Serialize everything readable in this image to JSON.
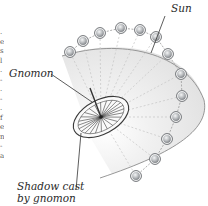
{
  "labels": {
    "sun": "Sun",
    "gnomon": "Gnomon",
    "shadow_line1": "Shadow cast",
    "shadow_line2": "by gnomon"
  },
  "edge_text_fragments": [
    ".",
    "e",
    "s",
    "l",
    ".",
    "-",
    ".",
    "-",
    ".",
    "f",
    "e",
    "n",
    "-",
    "a"
  ],
  "colors": {
    "background": "#ffffff",
    "dome_fill": "#e8e8e8",
    "dome_edge": "#8c8c8c",
    "sun_body": "#b9bcbf",
    "sun_ring": "#6e7175",
    "rays": "#c4c4c4",
    "dial_lines": "#3a3a3a",
    "text": "#2a2a2a"
  },
  "diagram": {
    "sun_count": 13,
    "dial_spokes": 24
  }
}
